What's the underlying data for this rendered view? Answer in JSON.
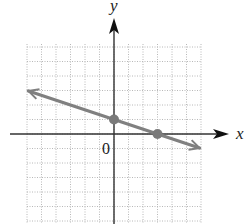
{
  "chart_data": {
    "type": "line",
    "title": "",
    "xlabel": "x",
    "ylabel": "y",
    "origin_label": "0",
    "xlim": [
      -6,
      6
    ],
    "ylim": [
      -6,
      6
    ],
    "grid": true,
    "grid_step": 1,
    "tick_labels": false,
    "series": [
      {
        "name": "line",
        "equation": "y = -x/3 + 1",
        "slope": -0.3333,
        "intercept": 1,
        "x": [
          -5.9,
          5.9
        ],
        "y": [
          2.97,
          -0.97
        ],
        "arrows": "both",
        "color": "#808080"
      }
    ],
    "points": [
      {
        "label": "y-intercept",
        "x": 0,
        "y": 1
      },
      {
        "label": "x-intercept",
        "x": 3,
        "y": 0
      }
    ],
    "colors": {
      "axis": "#333333",
      "grid": "#b8b8b8",
      "line": "#808080",
      "point": "#7a7a7a"
    }
  }
}
